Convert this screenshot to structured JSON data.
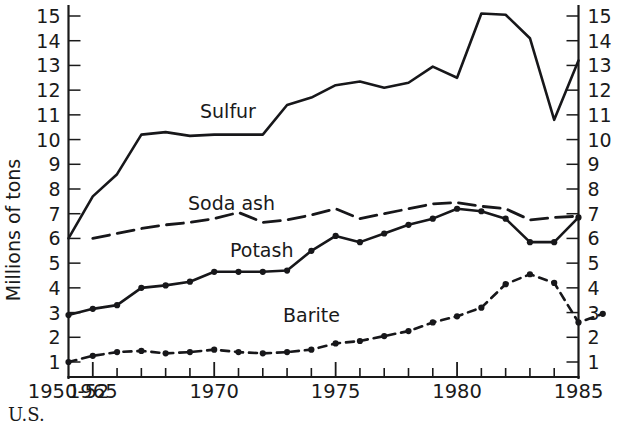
{
  "figure": {
    "caption_partial": "U.S. ",
    "y_axis_title": "Millions of tons"
  },
  "chart_data": {
    "type": "line",
    "title": "",
    "xlabel": "",
    "ylabel": "Millions of tons",
    "ylim": [
      0,
      15.6
    ],
    "xlim": [
      0,
      21
    ],
    "grid": false,
    "legend": "inline-labels",
    "y_ticks": [
      1,
      2,
      3,
      4,
      5,
      6,
      7,
      8,
      9,
      10,
      11,
      12,
      13,
      14,
      15
    ],
    "y_tick_labels": [
      "1",
      "2",
      "3",
      "4",
      "5",
      "6",
      "7",
      "8",
      "9",
      "10",
      "11",
      "12",
      "13",
      "14",
      "15"
    ],
    "y_axis_mirrored": true,
    "x_tick_indices": [
      0,
      1,
      2,
      3,
      4,
      5,
      6,
      7,
      8,
      9,
      10,
      11,
      12,
      13,
      14,
      15,
      16,
      17,
      18,
      19,
      20,
      21
    ],
    "x_major_tick_indices": [
      0,
      1,
      6,
      11,
      16,
      21
    ],
    "x_labeled_ticks": [
      {
        "index": 0,
        "label": "1950-52"
      },
      {
        "index": 1,
        "label": "1965"
      },
      {
        "index": 6,
        "label": "1970"
      },
      {
        "index": 11,
        "label": "1975"
      },
      {
        "index": 16,
        "label": "1980"
      },
      {
        "index": 21,
        "label": "1985"
      }
    ],
    "x_categories": [
      "1950-52",
      "1964",
      "1965",
      "1966",
      "1967",
      "1968",
      "1969",
      "1970",
      "1971",
      "1972",
      "1973",
      "1974",
      "1975",
      "1976",
      "1977",
      "1978",
      "1979",
      "1980",
      "1981",
      "1982",
      "1983",
      "1984"
    ],
    "series": [
      {
        "name": "Sulfur",
        "style": "solid",
        "markers": false,
        "label_position": {
          "x": 200,
          "y": 118
        },
        "points": [
          {
            "x": 0,
            "y": 6.0
          },
          {
            "x": 1,
            "y": 7.7
          },
          {
            "x": 2,
            "y": 8.6
          },
          {
            "x": 3,
            "y": 10.2
          },
          {
            "x": 4,
            "y": 10.3
          },
          {
            "x": 5,
            "y": 10.15
          },
          {
            "x": 6,
            "y": 10.2
          },
          {
            "x": 7,
            "y": 10.2
          },
          {
            "x": 8,
            "y": 10.2
          },
          {
            "x": 9,
            "y": 11.4
          },
          {
            "x": 10,
            "y": 11.7
          },
          {
            "x": 11,
            "y": 12.2
          },
          {
            "x": 12,
            "y": 12.35
          },
          {
            "x": 13,
            "y": 12.1
          },
          {
            "x": 14,
            "y": 12.3
          },
          {
            "x": 15,
            "y": 12.95
          },
          {
            "x": 16,
            "y": 12.5
          },
          {
            "x": 17,
            "y": 15.1
          },
          {
            "x": 18,
            "y": 15.05
          },
          {
            "x": 19,
            "y": 14.1
          },
          {
            "x": 20,
            "y": 10.8
          },
          {
            "x": 21,
            "y": 13.2
          }
        ]
      },
      {
        "name": "Soda ash",
        "style": "long-dash",
        "markers": false,
        "label_position": {
          "x": 188,
          "y": 210
        },
        "points": [
          {
            "x": 1,
            "y": 6.0
          },
          {
            "x": 2,
            "y": 6.2
          },
          {
            "x": 3,
            "y": 6.4
          },
          {
            "x": 4,
            "y": 6.55
          },
          {
            "x": 5,
            "y": 6.65
          },
          {
            "x": 6,
            "y": 6.8
          },
          {
            "x": 7,
            "y": 7.05
          },
          {
            "x": 8,
            "y": 6.65
          },
          {
            "x": 9,
            "y": 6.75
          },
          {
            "x": 10,
            "y": 6.95
          },
          {
            "x": 11,
            "y": 7.2
          },
          {
            "x": 12,
            "y": 6.8
          },
          {
            "x": 13,
            "y": 7.0
          },
          {
            "x": 14,
            "y": 7.2
          },
          {
            "x": 15,
            "y": 7.4
          },
          {
            "x": 16,
            "y": 7.45
          },
          {
            "x": 17,
            "y": 7.3
          },
          {
            "x": 18,
            "y": 7.2
          },
          {
            "x": 19,
            "y": 6.75
          },
          {
            "x": 20,
            "y": 6.85
          },
          {
            "x": 21,
            "y": 6.9
          }
        ]
      },
      {
        "name": "Potash",
        "style": "solid",
        "markers": true,
        "label_position": {
          "x": 230,
          "y": 257
        },
        "points": [
          {
            "x": 0,
            "y": 2.9
          },
          {
            "x": 1,
            "y": 3.15
          },
          {
            "x": 2,
            "y": 3.3
          },
          {
            "x": 3,
            "y": 4.0
          },
          {
            "x": 4,
            "y": 4.1
          },
          {
            "x": 5,
            "y": 4.25
          },
          {
            "x": 6,
            "y": 4.65
          },
          {
            "x": 7,
            "y": 4.65
          },
          {
            "x": 8,
            "y": 4.65
          },
          {
            "x": 9,
            "y": 4.7
          },
          {
            "x": 10,
            "y": 5.5
          },
          {
            "x": 11,
            "y": 6.1
          },
          {
            "x": 12,
            "y": 5.85
          },
          {
            "x": 13,
            "y": 6.2
          },
          {
            "x": 14,
            "y": 6.55
          },
          {
            "x": 15,
            "y": 6.8
          },
          {
            "x": 16,
            "y": 7.2
          },
          {
            "x": 17,
            "y": 7.1
          },
          {
            "x": 18,
            "y": 6.8
          },
          {
            "x": 19,
            "y": 5.85
          },
          {
            "x": 20,
            "y": 5.85
          },
          {
            "x": 21,
            "y": 6.85
          }
        ]
      },
      {
        "name": "Barite",
        "style": "short-dash",
        "markers": true,
        "label_position": {
          "x": 283,
          "y": 322
        },
        "points": [
          {
            "x": 0,
            "y": 1.0
          },
          {
            "x": 1,
            "y": 1.25
          },
          {
            "x": 2,
            "y": 1.4
          },
          {
            "x": 3,
            "y": 1.45
          },
          {
            "x": 4,
            "y": 1.35
          },
          {
            "x": 5,
            "y": 1.4
          },
          {
            "x": 6,
            "y": 1.5
          },
          {
            "x": 7,
            "y": 1.4
          },
          {
            "x": 8,
            "y": 1.35
          },
          {
            "x": 9,
            "y": 1.4
          },
          {
            "x": 10,
            "y": 1.5
          },
          {
            "x": 11,
            "y": 1.75
          },
          {
            "x": 12,
            "y": 1.85
          },
          {
            "x": 13,
            "y": 2.05
          },
          {
            "x": 14,
            "y": 2.25
          },
          {
            "x": 15,
            "y": 2.6
          },
          {
            "x": 16,
            "y": 2.85
          },
          {
            "x": 17,
            "y": 3.2
          },
          {
            "x": 18,
            "y": 4.15
          },
          {
            "x": 19,
            "y": 4.55
          },
          {
            "x": 20,
            "y": 4.2
          },
          {
            "x": 21,
            "y": 2.6
          },
          {
            "x": 22,
            "y": 2.95
          }
        ]
      }
    ]
  }
}
